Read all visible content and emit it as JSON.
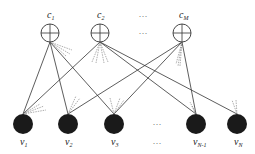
{
  "diagram": {
    "type": "bipartite-network",
    "top_nodes": [
      {
        "id": "c1",
        "label": "c",
        "sub": "1",
        "x": 50,
        "y": 33,
        "r": 9,
        "style": "circle-plus"
      },
      {
        "id": "c2",
        "label": "c",
        "sub": "2",
        "x": 100,
        "y": 33,
        "r": 9,
        "style": "circle-plus"
      },
      {
        "id": "cM",
        "label": "c",
        "sub": "M",
        "x": 182,
        "y": 33,
        "r": 9,
        "style": "circle-plus"
      }
    ],
    "bottom_nodes": [
      {
        "id": "v1",
        "label": "v",
        "sub": "1",
        "x": 23,
        "y": 124,
        "r": 10,
        "style": "filled"
      },
      {
        "id": "v2",
        "label": "v",
        "sub": "2",
        "x": 68,
        "y": 124,
        "r": 10,
        "style": "filled"
      },
      {
        "id": "v3",
        "label": "v",
        "sub": "3",
        "x": 114,
        "y": 124,
        "r": 10,
        "style": "filled"
      },
      {
        "id": "vN-1",
        "label": "v",
        "sub": "N-1",
        "x": 196,
        "y": 124,
        "r": 10,
        "style": "filled"
      },
      {
        "id": "vN",
        "label": "v",
        "sub": "N",
        "x": 237,
        "y": 124,
        "r": 10,
        "style": "filled"
      }
    ],
    "edges": [
      {
        "from": "c1",
        "to": "v1"
      },
      {
        "from": "c1",
        "to": "v2"
      },
      {
        "from": "c1",
        "to": "v3"
      },
      {
        "from": "c2",
        "to": "v1"
      },
      {
        "from": "c2",
        "to": "vN-1"
      },
      {
        "from": "c2",
        "to": "vN"
      },
      {
        "from": "cM",
        "to": "v2"
      },
      {
        "from": "cM",
        "to": "v3"
      },
      {
        "from": "cM",
        "to": "vN-1"
      }
    ],
    "ellipsis": "···",
    "colors": {
      "stroke": "#333333",
      "node_fill": "#1a1a1a",
      "dash": "#777777"
    }
  }
}
